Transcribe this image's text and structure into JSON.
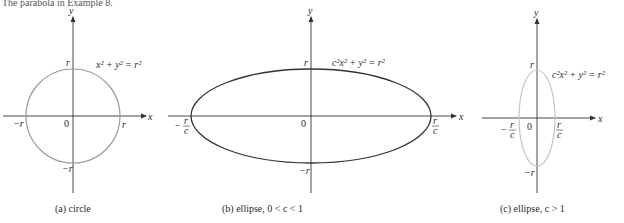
{
  "header_text": "The parabola in Example 8.",
  "colors": {
    "axis": "#333333",
    "circle": "#9a9a9a",
    "ellipse_b": "#333333",
    "ellipse_c": "#c4c4c4",
    "text": "#2a2a2a"
  },
  "panels": [
    {
      "id": "a",
      "equation": "x² + y² = r²",
      "caption": "(a) circle",
      "labels": {
        "y_axis": "y",
        "x_axis": "x",
        "origin": "0",
        "top": "r",
        "bottom": "−r",
        "left": "−r",
        "right": "r"
      }
    },
    {
      "id": "b",
      "equation": "c²x² + y² = r²",
      "caption": "(b) ellipse, 0 < c < 1",
      "labels": {
        "y_axis": "y",
        "x_axis": "x",
        "origin": "0",
        "top": "r",
        "bottom": "−r",
        "left_num": "r",
        "left_den": "c",
        "left_sign": "−",
        "right_num": "r",
        "right_den": "c"
      }
    },
    {
      "id": "c",
      "equation": "c²x² + y² = r²",
      "caption": "(c) ellipse,  c > 1",
      "labels": {
        "y_axis": "y",
        "x_axis": "x",
        "origin": "0",
        "top": "r",
        "bottom": "−r",
        "left_num": "r",
        "left_den": "c",
        "left_sign": "−",
        "right_num": "r",
        "right_den": "c"
      }
    }
  ]
}
